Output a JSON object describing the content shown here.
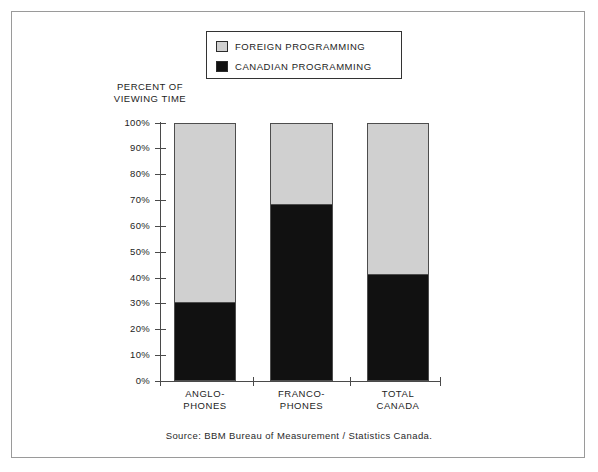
{
  "figure": {
    "source_note": "Source: BBM Bureau of Measurement / Statistics Canada."
  },
  "legend": {
    "position": "top-center",
    "items": [
      {
        "label": "FOREIGN PROGRAMMING",
        "color": "#d0d0d0",
        "swatch": "foreign-swatch"
      },
      {
        "label": "CANADIAN PROGRAMMING",
        "color": "#111111",
        "swatch": "canadian-swatch"
      }
    ]
  },
  "axis_title": {
    "line1": "PERCENT OF",
    "line2": "VIEWING TIME"
  },
  "y_axis": {
    "ticks": [
      "100%",
      "90%",
      "80%",
      "70%",
      "60%",
      "50%",
      "40%",
      "30%",
      "20%",
      "10%",
      "0%"
    ]
  },
  "x_axis": {
    "categories": [
      {
        "line1": "ANGLO-",
        "line2": "PHONES"
      },
      {
        "line1": "FRANCO-",
        "line2": "PHONES"
      },
      {
        "line1": "TOTAL",
        "line2": "CANADA"
      }
    ]
  },
  "chart_data": {
    "type": "bar",
    "stacked": true,
    "stack_total": 100,
    "title": "",
    "subtitle": "",
    "xlabel": "",
    "ylabel": "PERCENT OF VIEWING TIME",
    "ylim": [
      0,
      100
    ],
    "ytick_values": [
      100,
      90,
      80,
      70,
      60,
      50,
      40,
      30,
      20,
      10,
      0
    ],
    "ytick_labels": [
      "100%",
      "90%",
      "80%",
      "70%",
      "60%",
      "50%",
      "40%",
      "30%",
      "20%",
      "10%",
      "0%"
    ],
    "grid": false,
    "legend_position": "top-center",
    "categories": [
      "ANGLO-PHONES",
      "FRANCO-PHONES",
      "TOTAL CANADA"
    ],
    "series": [
      {
        "name": "CANADIAN PROGRAMMING",
        "color": "#111111",
        "values": [
          30,
          68,
          41
        ]
      },
      {
        "name": "FOREIGN PROGRAMMING",
        "color": "#d0d0d0",
        "values": [
          70,
          32,
          59
        ]
      }
    ],
    "annotations": [
      "Source: BBM Bureau of Measurement / Statistics Canada."
    ]
  }
}
